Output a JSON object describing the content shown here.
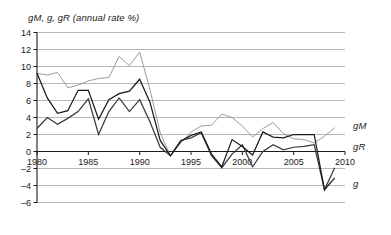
{
  "chart_data": {
    "type": "line",
    "title": "gM, g, gR (annual rate %)",
    "xlabel": "",
    "ylabel": "",
    "xlim": [
      1980,
      2010
    ],
    "ylim": [
      -6,
      14
    ],
    "yticks": [
      14,
      12,
      10,
      8,
      6,
      4,
      2,
      0,
      -2,
      -4,
      -6
    ],
    "xticks": [
      1980,
      1985,
      1990,
      1995,
      2000,
      2005,
      2010
    ],
    "grid": true,
    "legend_position": "right-inline",
    "x": [
      1980,
      1981,
      1982,
      1983,
      1984,
      1985,
      1986,
      1987,
      1988,
      1989,
      1990,
      1991,
      1992,
      1993,
      1994,
      1995,
      1996,
      1997,
      1998,
      1999,
      2000,
      2001,
      2002,
      2003,
      2004,
      2005,
      2006,
      2007,
      2008,
      2009
    ],
    "series": [
      {
        "name": "gM",
        "label": "gM",
        "color": "#8a8a8a",
        "values": [
          9.2,
          9.0,
          9.3,
          7.5,
          7.8,
          8.3,
          8.6,
          8.7,
          11.2,
          10.1,
          11.7,
          7.3,
          2.2,
          -0.5,
          1.0,
          2.3,
          3.0,
          3.1,
          4.4,
          4.0,
          3.0,
          1.7,
          2.7,
          3.4,
          2.1,
          1.5,
          1.4,
          1.0,
          1.8,
          2.8
        ]
      },
      {
        "name": "g",
        "label": "g",
        "color": "#3a3a3a",
        "values": [
          2.7,
          4.0,
          3.2,
          3.9,
          4.7,
          6.2,
          2.0,
          4.7,
          6.3,
          4.7,
          6.1,
          3.5,
          0.5,
          -0.5,
          1.3,
          1.6,
          2.2,
          -0.5,
          -1.9,
          -0.3,
          0.8,
          -1.8,
          0.0,
          0.8,
          0.2,
          0.5,
          0.6,
          0.8,
          -4.5,
          -1.9
        ]
      },
      {
        "name": "gR",
        "label": "gR",
        "color": "#1a1a1a",
        "values": [
          9.2,
          6.3,
          4.5,
          4.8,
          7.2,
          7.2,
          3.8,
          6.1,
          6.8,
          7.1,
          8.5,
          5.8,
          1.3,
          -0.5,
          1.2,
          1.9,
          2.3,
          -0.3,
          -1.8,
          1.4,
          0.6,
          -0.4,
          2.3,
          1.7,
          1.6,
          2.0,
          2.0,
          2.0,
          -4.5,
          -3.1
        ]
      }
    ],
    "series_labels": [
      {
        "name": "gM",
        "text": "gM",
        "x": 2010.4,
        "y": 3.0
      },
      {
        "name": "gR",
        "text": "gR",
        "x": 2010.4,
        "y": 0.5
      },
      {
        "name": "g",
        "text": "g",
        "x": 2010.4,
        "y": -3.8
      }
    ]
  }
}
